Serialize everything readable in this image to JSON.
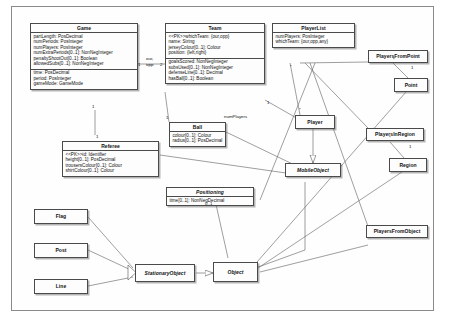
{
  "diagram": {
    "caption": ""
  },
  "classes": [
    {
      "id": "game",
      "name": "Game",
      "abstract": false,
      "sections": [
        [
          "partLength: PosDecimal",
          "numPeriods: PosInteger",
          "numPlayers: PosInteger",
          "numExtraPeriods[0..1]: NonNegInteger",
          "penaltyShootOut[0..1]: Boolean",
          "allowedSubs[0..1]: NonNegInteger"
        ],
        [
          "time: PosDecimal",
          "period: PosInteger",
          "gameMode: GameMode"
        ]
      ]
    },
    {
      "id": "team",
      "name": "Team",
      "abstract": false,
      "sections": [
        [
          "<<PK>>whichTeam: {our,opp}",
          "name: String",
          "jerseyColour[0..1]: Colour",
          "position: {left,right}"
        ],
        [
          "goalsScored: NonNegInteger",
          "subsUsed[0..1]: NonNegInteger",
          "defenseLine[0..1]: Decimal",
          "hasBall[0..1]: Boolean"
        ]
      ]
    },
    {
      "id": "playerlist",
      "name": "PlayerList",
      "abstract": false,
      "sections": [
        [
          "numPlayers: PosInteger",
          "whichTeam: {our,opp,any}"
        ]
      ]
    },
    {
      "id": "ball",
      "name": "Ball",
      "abstract": false,
      "sections": [
        [
          "colour[0..1]: Colour",
          "radius[0..1]: PosDecimal"
        ]
      ]
    },
    {
      "id": "referee",
      "name": "Referee",
      "abstract": false,
      "sections": [
        [
          "<<PK>>id: Identifier",
          "height[0..1]: PosDecimal",
          "trousersColour[0..1]: Colour",
          "shirtColour[0..1]: Colour"
        ]
      ]
    },
    {
      "id": "positioning",
      "name": "Positioning",
      "abstract": true,
      "sections": [
        [
          "time[0..1]: NonNegDecimal"
        ]
      ]
    },
    {
      "id": "playersfrompoint",
      "name": "PlayersFromPoint",
      "abstract": false,
      "sections": []
    },
    {
      "id": "point",
      "name": "Point",
      "abstract": false,
      "sections": []
    },
    {
      "id": "playersinregion",
      "name": "PlayersInRegion",
      "abstract": false,
      "sections": []
    },
    {
      "id": "region",
      "name": "Region",
      "abstract": false,
      "sections": []
    },
    {
      "id": "playersfromobject",
      "name": "PlayersFromObject",
      "abstract": false,
      "sections": []
    },
    {
      "id": "player",
      "name": "Player",
      "abstract": false,
      "sections": []
    },
    {
      "id": "mobileobject",
      "name": "MobileObject",
      "abstract": true,
      "sections": []
    },
    {
      "id": "stationaryobject",
      "name": "StationaryObject",
      "abstract": true,
      "sections": []
    },
    {
      "id": "object",
      "name": "Object",
      "abstract": true,
      "sections": []
    },
    {
      "id": "flag",
      "name": "Flag",
      "abstract": false,
      "sections": []
    },
    {
      "id": "post",
      "name": "Post",
      "abstract": false,
      "sections": []
    },
    {
      "id": "line",
      "name": "Line",
      "abstract": false,
      "sections": []
    }
  ],
  "edge_labels": [
    {
      "id": "our_opp",
      "text": "our,",
      "x": 146,
      "y": 59
    },
    {
      "id": "our_opp2",
      "text": "opp",
      "x": 146,
      "y": 65
    },
    {
      "id": "mult_game_1",
      "text": "1",
      "x": 139,
      "y": 65
    },
    {
      "id": "mult_team_2",
      "text": "2",
      "x": 161,
      "y": 65
    },
    {
      "id": "mult_game_bottom",
      "text": "1",
      "x": 94,
      "y": 107
    },
    {
      "id": "mult_ball_1",
      "text": "1",
      "x": 167,
      "y": 118
    },
    {
      "id": "mult_referee_1",
      "text": "1",
      "x": 97,
      "y": 138
    },
    {
      "id": "numplayers",
      "text": "numPlayers",
      "x": 227,
      "y": 117
    },
    {
      "id": "mult_team_right",
      "text": "1",
      "x": 268,
      "y": 103
    },
    {
      "id": "mult_playerlist_star",
      "text": "*",
      "x": 291,
      "y": 68
    },
    {
      "id": "mult_player_star",
      "text": "*",
      "x": 300,
      "y": 110
    },
    {
      "id": "mult_point_1",
      "text": "1",
      "x": 412,
      "y": 68
    },
    {
      "id": "mult_region_1",
      "text": "1",
      "x": 410,
      "y": 146
    },
    {
      "id": "mult_pfp_star",
      "text": "*",
      "x": 394,
      "y": 58
    },
    {
      "id": "mult_pir_star",
      "text": "*",
      "x": 390,
      "y": 137
    },
    {
      "id": "mult_positioning_01",
      "text": "0..1",
      "x": 207,
      "y": 205
    }
  ],
  "figure_caption": ""
}
